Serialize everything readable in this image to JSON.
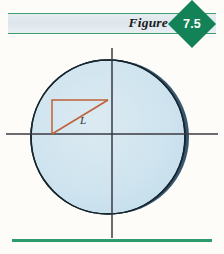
{
  "figure": {
    "label": "Figure",
    "number": "7.5"
  },
  "colors": {
    "badge_green": "#148257",
    "rule_green": "#3f9e74",
    "baseline_green": "#2f9a6d",
    "header_band": "#dde6ed",
    "disk_fill": "#cfe4ef",
    "disk_edge": "#16252e",
    "disk_shadow": "#5a8bb0",
    "disk_shadow_light": "#94b6cf",
    "triangle": "#bf6339",
    "axis": "#3a3a42",
    "label_text": "#2b3340",
    "page_background": "#fdfcf8"
  },
  "diagram": {
    "type": "geometric-figure",
    "circle": {
      "center_x": 108,
      "center_y": 137,
      "radius": 77
    },
    "axes": {
      "horizontal_y": 134,
      "horizontal_x1": 6,
      "horizontal_x2": 218,
      "vertical_x": 112,
      "vertical_y1": 48,
      "vertical_y2": 238
    },
    "triangle": {
      "vertices": [
        {
          "x": 52,
          "y": 100
        },
        {
          "x": 108,
          "y": 100
        },
        {
          "x": 52,
          "y": 134
        }
      ],
      "right_angle_at": {
        "x": 52,
        "y": 100
      },
      "hypotenuse_from": {
        "x": 52,
        "y": 134
      },
      "hypotenuse_to": {
        "x": 108,
        "y": 100
      }
    },
    "labels": [
      {
        "text": "L",
        "x": 80,
        "y": 120,
        "style": "italic"
      }
    ]
  }
}
